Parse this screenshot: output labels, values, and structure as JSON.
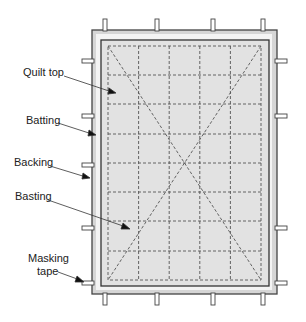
{
  "diagram": {
    "labels": {
      "quilt_top": "Quilt top",
      "batting": "Batting",
      "backing": "Backing",
      "basting": "Basting",
      "masking_tape_1": "Masking",
      "masking_tape_2": "tape"
    },
    "colors": {
      "backing_fill": "#d6d6d6",
      "batting_fill": "#f4f4f4",
      "quilt_fill": "#e2e2e2",
      "line": "#444444",
      "tape_fill": "#ffffff"
    },
    "grid": {
      "columns": 5,
      "rows": 8
    }
  }
}
